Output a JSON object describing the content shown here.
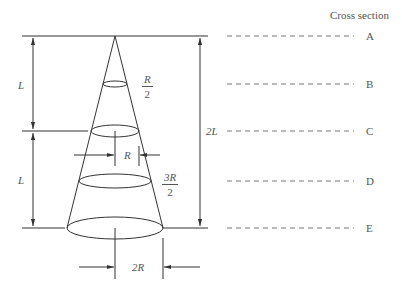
{
  "header": {
    "title": "Cross section"
  },
  "sections": [
    {
      "label": "A",
      "y": 36
    },
    {
      "label": "B",
      "y": 84
    },
    {
      "label": "C",
      "y": 131
    },
    {
      "label": "D",
      "y": 181
    },
    {
      "label": "E",
      "y": 228
    }
  ],
  "dimensions": {
    "upper_length": "L",
    "lower_length": "L",
    "total_length": "2L",
    "radius_b_num": "R",
    "radius_b_den": "2",
    "radius_c": "R",
    "radius_d_num": "3R",
    "radius_d_den": "2",
    "base_diameter": "2R"
  },
  "colors": {
    "line": "#333333",
    "dash": "#777777",
    "text": "#555555"
  }
}
